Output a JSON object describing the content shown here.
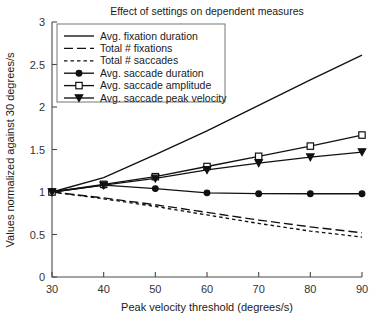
{
  "chart_data": {
    "type": "line",
    "title": "Effect of settings on dependent measures",
    "xlabel": "Peak velocity threshold (degrees/s)",
    "ylabel": "Values normalized against 30 degrees/s",
    "x": [
      30,
      40,
      50,
      60,
      70,
      80,
      90
    ],
    "xlim": [
      30,
      90
    ],
    "ylim": [
      0,
      3
    ],
    "xticks": [
      30,
      40,
      50,
      60,
      70,
      80,
      90
    ],
    "xtick_labels": [
      "30",
      "40",
      "50",
      "60",
      "70",
      "80",
      "90"
    ],
    "yticks": [
      0,
      0.5,
      1,
      1.5,
      2,
      2.5,
      3
    ],
    "ytick_labels": [
      "0",
      "0.5",
      "1",
      "1.5",
      "2",
      "2.5",
      "3"
    ],
    "grid": false,
    "legend_position": "top-left-inside",
    "series": [
      {
        "name": "Avg. fixation duration",
        "style": "solid",
        "marker": "none",
        "values": [
          1.0,
          1.17,
          1.44,
          1.72,
          2.02,
          2.32,
          2.61
        ]
      },
      {
        "name": "Total # fixations",
        "style": "dashed",
        "marker": "none",
        "values": [
          1.0,
          0.93,
          0.85,
          0.76,
          0.67,
          0.59,
          0.52
        ]
      },
      {
        "name": "Total # saccades",
        "style": "dotted",
        "marker": "none",
        "values": [
          1.0,
          0.92,
          0.83,
          0.73,
          0.63,
          0.54,
          0.47
        ]
      },
      {
        "name": "Avg. saccade duration",
        "style": "solid",
        "marker": "circle-filled",
        "values": [
          1.0,
          1.08,
          1.04,
          0.99,
          0.98,
          0.98,
          0.98
        ]
      },
      {
        "name": "Avg. saccade amplitude",
        "style": "solid",
        "marker": "square-open",
        "values": [
          1.0,
          1.09,
          1.18,
          1.3,
          1.42,
          1.54,
          1.67
        ]
      },
      {
        "name": "Avg. saccade peak velocity",
        "style": "solid",
        "marker": "triangle-down-filled",
        "values": [
          1.0,
          1.08,
          1.16,
          1.26,
          1.34,
          1.41,
          1.47
        ]
      }
    ]
  },
  "colors": {
    "line": "#111111",
    "axis": "#4a4a4a",
    "legend_border": "#777777",
    "background": "#ffffff"
  }
}
